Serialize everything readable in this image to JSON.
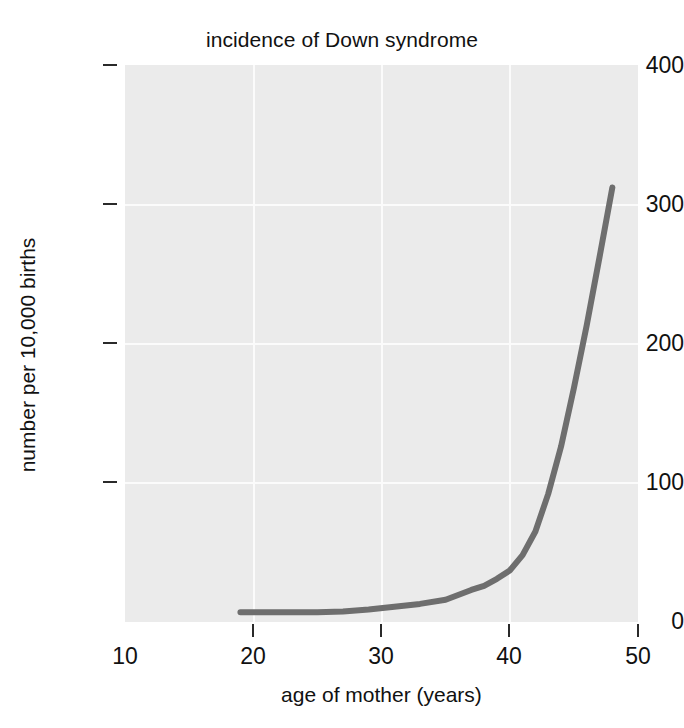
{
  "chart_data": {
    "type": "line",
    "title": "incidence of Down syndrome",
    "xlabel": "age of mother (years)",
    "ylabel": "number per 10,000 births",
    "xlim": [
      10,
      50
    ],
    "ylim": [
      0,
      400
    ],
    "xticks": [
      10,
      20,
      30,
      40,
      50
    ],
    "xtick_labels": [
      "10",
      "20",
      "30",
      "40",
      "50"
    ],
    "yticks": [
      0,
      100,
      200,
      300,
      400
    ],
    "ytick_labels": [
      "0",
      "100",
      "200",
      "300",
      "400"
    ],
    "grid": true,
    "legend": "none",
    "series": [
      {
        "name": "incidence",
        "color": "#6e6e6e",
        "x": [
          19,
          21,
          23,
          25,
          27,
          29,
          31,
          33,
          35,
          37,
          38,
          39,
          40,
          41,
          42,
          43,
          44,
          45,
          46,
          47,
          48
        ],
        "y": [
          7,
          7,
          7,
          7,
          7.5,
          9,
          11,
          13,
          16,
          23,
          26,
          31,
          37,
          48,
          65,
          92,
          126,
          168,
          213,
          262,
          312
        ]
      }
    ]
  },
  "axes": {
    "y_ticks": [
      {
        "label": "400",
        "value": 400
      },
      {
        "label": "300",
        "value": 300
      },
      {
        "label": "200",
        "value": 200
      },
      {
        "label": "100",
        "value": 100
      },
      {
        "label": "0",
        "value": 0
      }
    ],
    "x_ticks": [
      {
        "label": "10",
        "value": 10
      },
      {
        "label": "20",
        "value": 20
      },
      {
        "label": "30",
        "value": 30
      },
      {
        "label": "40",
        "value": 40
      },
      {
        "label": "50",
        "value": 50
      }
    ]
  },
  "colors": {
    "plot_background": "#ebebeb",
    "gridline": "#fbfbfb",
    "line": "#6e6e6e",
    "text": "#111111",
    "page_background": "#ffffff"
  }
}
